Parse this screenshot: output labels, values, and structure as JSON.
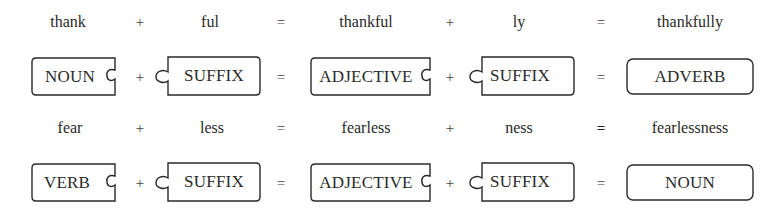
{
  "rows": [
    {
      "words": [
        "thank",
        "ful",
        "thankful",
        "ly",
        "thankfully"
      ],
      "operators": [
        "+",
        "=",
        "+",
        "="
      ],
      "pieces": [
        "NOUN",
        "SUFFIX",
        "ADJECTIVE",
        "SUFFIX",
        "ADVERB"
      ],
      "piece_operators": [
        "+",
        "=",
        "+",
        "="
      ]
    },
    {
      "words": [
        "fear",
        "less",
        "fearless",
        "ness",
        "fearlessness"
      ],
      "operators": [
        "+",
        "=",
        "+",
        "="
      ],
      "pieces": [
        "VERB",
        "SUFFIX",
        "ADJECTIVE",
        "SUFFIX",
        "NOUN"
      ],
      "piece_operators": [
        "+",
        "=",
        "+",
        "="
      ]
    }
  ],
  "colors": {
    "stroke": "#2a2a2a",
    "text": "#2a2a2a",
    "background": "#ffffff"
  }
}
